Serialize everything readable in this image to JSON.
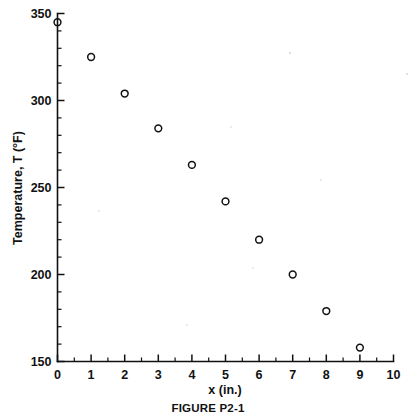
{
  "figure": {
    "caption": "FIGURE P2-1",
    "background_color": "#ffffff",
    "ink_color": "#111111"
  },
  "chart_data": {
    "type": "scatter",
    "title": "",
    "xlabel": "x (in.)",
    "ylabel": "Temperature, T (°F)",
    "xlim": [
      0,
      10
    ],
    "ylim": [
      150,
      350
    ],
    "grid": false,
    "legend": null,
    "marker_style": "open-circle",
    "x": [
      0,
      1,
      2,
      3,
      4,
      5,
      6,
      7,
      8,
      9
    ],
    "y": [
      345,
      325,
      304,
      284,
      263,
      242,
      220,
      200,
      179,
      158
    ],
    "points": [
      {
        "x": 0,
        "y": 345
      },
      {
        "x": 1,
        "y": 325
      },
      {
        "x": 2,
        "y": 304
      },
      {
        "x": 3,
        "y": 284
      },
      {
        "x": 4,
        "y": 263
      },
      {
        "x": 5,
        "y": 242
      },
      {
        "x": 6,
        "y": 220
      },
      {
        "x": 7,
        "y": 200
      },
      {
        "x": 8,
        "y": 179
      },
      {
        "x": 9,
        "y": 158
      }
    ],
    "x_ticks_major": [
      0,
      1,
      2,
      3,
      4,
      5,
      6,
      7,
      8,
      9,
      10
    ],
    "x_tick_labels": [
      "0",
      "1",
      "2",
      "3",
      "4",
      "5",
      "6",
      "7",
      "8",
      "9",
      "10"
    ],
    "x_minor_interval": 0.5,
    "y_ticks_major": [
      150,
      200,
      250,
      300,
      350
    ],
    "y_tick_labels": [
      "150",
      "200",
      "250",
      "300",
      "350"
    ],
    "y_minor_interval": 10
  }
}
